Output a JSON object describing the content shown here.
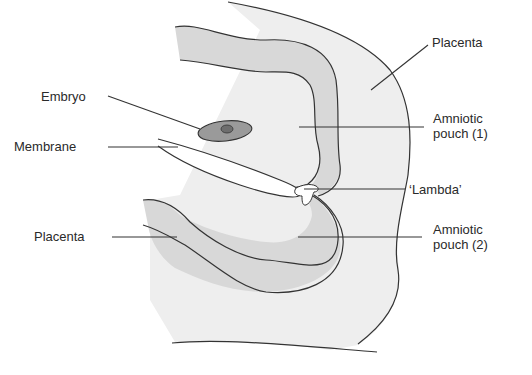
{
  "diagram": {
    "type": "anatomical cross-section",
    "colors": {
      "outline": "#333333",
      "outer_placenta_fill": "#ededed",
      "inner_chorion_fill": "#d9d9d9",
      "embryo_fill": "#9a9a9a",
      "embryo_core_fill": "#6e6e6e",
      "background": "#ffffff"
    },
    "labels": {
      "placenta_top": "Placenta",
      "embryo": "Embryo",
      "membrane": "Membrane",
      "amniotic_pouch_1_line1": "Amniotic",
      "amniotic_pouch_1_line2": "pouch (1)",
      "lambda": "‘Lambda’",
      "placenta_bottom": "Placenta",
      "amniotic_pouch_2_line1": "Amniotic",
      "amniotic_pouch_2_line2": "pouch (2)"
    }
  }
}
